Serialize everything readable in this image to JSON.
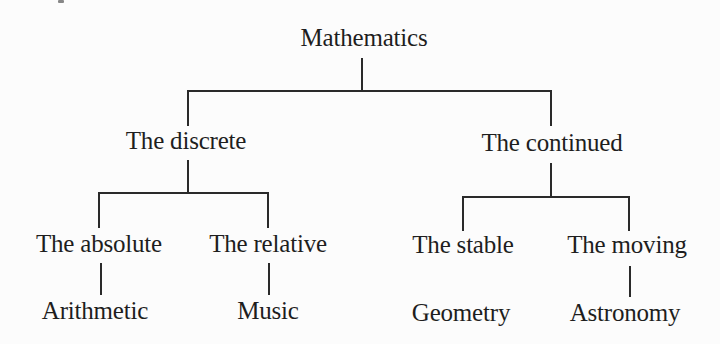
{
  "diagram": {
    "type": "tree",
    "root": {
      "label": "Mathematics",
      "children": [
        {
          "label": "The discrete",
          "children": [
            {
              "label": "The absolute",
              "leaf": "Arithmetic",
              "leaf_connected": true
            },
            {
              "label": "The relative",
              "leaf": "Music",
              "leaf_connected": true
            }
          ]
        },
        {
          "label": "The continued",
          "children": [
            {
              "label": "The stable",
              "leaf": "Geometry",
              "leaf_connected": false
            },
            {
              "label": "The moving",
              "leaf": "Astronomy",
              "leaf_connected": true
            }
          ]
        }
      ]
    },
    "colors": {
      "text": "#1e1e1e",
      "lines": "#2a2a2a",
      "background": "#fcfcfc"
    }
  }
}
